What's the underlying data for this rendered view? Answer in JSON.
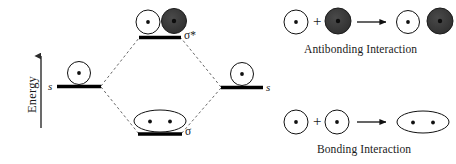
{
  "figure": {
    "background_color": "#ffffff",
    "ink_color": "#000000",
    "lobe_fill_dark": "#3a3a3a"
  },
  "mo_diagram": {
    "axis": {
      "label": "Energy",
      "direction": "up",
      "icon": "up-arrow-icon"
    },
    "levels": [
      {
        "id": "left-atomic",
        "label": "s",
        "label_side": "left",
        "orbital": "single-white-circle"
      },
      {
        "id": "right-atomic",
        "label": "s",
        "label_side": "right",
        "orbital": "single-white-circle"
      },
      {
        "id": "antibonding",
        "label": "σ*",
        "label_side": "right",
        "orbital": "white-circle-plus-dark-circle"
      },
      {
        "id": "bonding",
        "label": "σ",
        "label_side": "right",
        "orbital": "merged-ellipse-two-dots"
      }
    ],
    "correlation_lines": "dashed"
  },
  "interactions": {
    "antibonding": {
      "caption": "Antibonding Interaction",
      "plus_sign": "+",
      "arrow": "right-arrow-icon",
      "reactant_left": "white-circle",
      "reactant_right": "dark-circle",
      "product": "white-circle-and-dark-circle-separate"
    },
    "bonding": {
      "caption": "Bonding Interaction",
      "plus_sign": "+",
      "arrow": "right-arrow-icon",
      "reactant_left": "white-circle",
      "reactant_right": "white-circle",
      "product": "merged-ellipse-two-dots"
    }
  }
}
